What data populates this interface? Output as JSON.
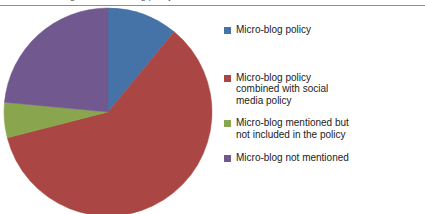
{
  "figure": {
    "clipped_caption": "Figure 1. Micro-blog policy",
    "background_color": "#ffffff"
  },
  "chart_data": {
    "type": "pie",
    "title": "",
    "subtitle": "",
    "xlabel": "",
    "ylabel": "",
    "grid": false,
    "legend_position": "right",
    "start_angle_deg": 0,
    "direction": "clockwise",
    "categories": [
      "Micro-blog policy",
      "Micro-blog policy combined with social media policy",
      "Micro-blog mentioned but not included in the policy",
      "Micro-blog not mentioned"
    ],
    "values": [
      11,
      60,
      5.5,
      23.5
    ],
    "value_unit": "percent",
    "colors": [
      "#4572A7",
      "#AA4643",
      "#89A54E",
      "#71588F"
    ],
    "slices": [
      {
        "label": "Micro-blog policy",
        "value": 11,
        "color": "#4572A7",
        "start_deg": 0,
        "end_deg": 39.6
      },
      {
        "label": "Micro-blog policy combined with social media policy",
        "value": 60,
        "color": "#AA4643",
        "start_deg": 39.6,
        "end_deg": 255.6
      },
      {
        "label": "Micro-blog mentioned but not included in the policy",
        "value": 5.5,
        "color": "#89A54E",
        "start_deg": 255.6,
        "end_deg": 275.4
      },
      {
        "label": "Micro-blog not mentioned",
        "value": 23.5,
        "color": "#71588F",
        "start_deg": 275.4,
        "end_deg": 360
      }
    ]
  },
  "legend": {
    "items": [
      {
        "label": "Micro-blog policy",
        "color": "#4572A7"
      },
      {
        "label": "Micro-blog policy combined with social media policy",
        "color": "#AA4643"
      },
      {
        "label": "Micro-blog mentioned but not included in the policy",
        "color": "#89A54E"
      },
      {
        "label": "Micro-blog not mentioned",
        "color": "#71588F"
      }
    ]
  }
}
